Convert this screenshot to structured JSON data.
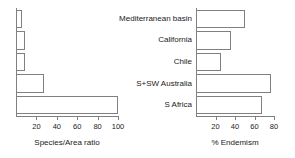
{
  "chart_data": [
    {
      "type": "bar",
      "orientation": "horizontal",
      "id": "species-area-ratio",
      "title": "",
      "xlabel": "Species/Area ratio",
      "ylabel": "",
      "xlim": [
        0,
        100
      ],
      "grid": false,
      "legend": null,
      "xticks": [
        "20",
        "40",
        "60",
        "80",
        "100"
      ],
      "xtick_values": [
        20,
        40,
        60,
        80,
        100
      ],
      "categories": [
        "Mediterranean basin",
        "California",
        "Chile",
        "S+SW Australia",
        "S Africa"
      ],
      "values": [
        6,
        9,
        9,
        27,
        100
      ]
    },
    {
      "type": "bar",
      "orientation": "horizontal",
      "id": "percent-endemism",
      "title": "",
      "xlabel": "% Endemism",
      "ylabel": "",
      "xlim": [
        0,
        80
      ],
      "grid": false,
      "legend": null,
      "xticks": [
        "20",
        "40",
        "60",
        "80"
      ],
      "xtick_values": [
        20,
        40,
        60,
        80
      ],
      "categories": [
        "Mediterranean basin",
        "California",
        "Chile",
        "S+SW Australia",
        "S Africa"
      ],
      "values": [
        50,
        36,
        26,
        77,
        68
      ]
    }
  ],
  "left_chart": {
    "axis_title": "Species/Area ratio",
    "ticks": [
      {
        "label": "20",
        "value": 20
      },
      {
        "label": "40",
        "value": 40
      },
      {
        "label": "60",
        "value": 60
      },
      {
        "label": "80",
        "value": 80
      },
      {
        "label": "100",
        "value": 100
      }
    ],
    "bars": [
      {
        "category": "Mediterranean basin",
        "value": 6
      },
      {
        "category": "California",
        "value": 9
      },
      {
        "category": "Chile",
        "value": 9
      },
      {
        "category": "S+SW Australia",
        "value": 27
      },
      {
        "category": "S Africa",
        "value": 100
      }
    ]
  },
  "right_chart": {
    "axis_title": "% Endemism",
    "ticks": [
      {
        "label": "20",
        "value": 20
      },
      {
        "label": "40",
        "value": 40
      },
      {
        "label": "60",
        "value": 60
      },
      {
        "label": "80",
        "value": 80
      }
    ],
    "bars": [
      {
        "category": "Mediterranean basin",
        "value": 50
      },
      {
        "category": "California",
        "value": 36
      },
      {
        "category": "Chile",
        "value": 26
      },
      {
        "category": "S+SW Australia",
        "value": 77
      },
      {
        "category": "S Africa",
        "value": 68
      }
    ]
  },
  "category_labels": [
    "Mediterranean basin",
    "California",
    "Chile",
    "S+SW Australia",
    "S Africa"
  ]
}
